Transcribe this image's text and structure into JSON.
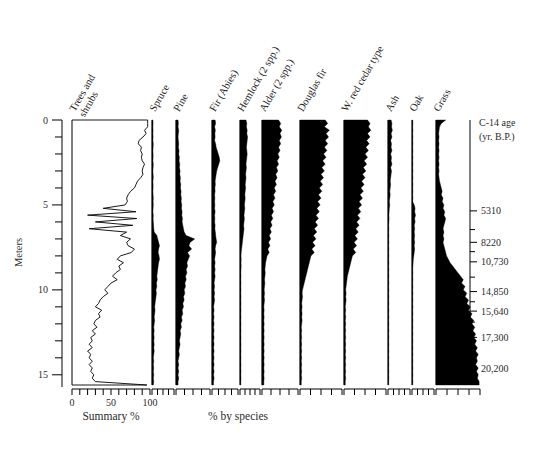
{
  "figure": {
    "type": "pollen-diagram",
    "background_color": "#ffffff",
    "ink_color": "#000000"
  },
  "axes": {
    "depth_axis": {
      "label": "Meters",
      "tick_labels": [
        "0",
        "5",
        "10",
        "15"
      ],
      "tick_values": [
        0,
        5,
        10,
        15
      ],
      "minor_interval": 1,
      "range": [
        0,
        15.6
      ]
    },
    "age_axis": {
      "title_line1": "C-14 age",
      "title_line2": "(yr. B.P.)",
      "tick_labels": [
        "5310",
        "8220",
        "10,730",
        "14,850",
        "15,640",
        "17,300",
        "20,200"
      ],
      "tick_depths_m": [
        5.35,
        7.2,
        8.35,
        10.1,
        11.25,
        12.8,
        14.65
      ],
      "minor_tick_depths_m": [
        6.45,
        7.75,
        9.25,
        10.7,
        11.9,
        13.8
      ]
    },
    "summary_axis": {
      "tick_labels": [
        "0",
        "50",
        "100"
      ],
      "tick_values": [
        0,
        50,
        100
      ],
      "minor_interval": 10,
      "caption": "Summary %"
    },
    "species_axis": {
      "caption": "% by species",
      "minor_ticks_per_column": 4
    }
  },
  "columns": [
    {
      "name": "trees-and-shrubs",
      "label": "Trees and\nshrubs",
      "label_lines": [
        "Trees and",
        "shrubs"
      ],
      "style": "line",
      "width_px": 78,
      "max_percent": 100,
      "axis": "summary"
    },
    {
      "name": "spruce",
      "label": "Spruce",
      "style": "silhouette",
      "width_px": 22,
      "axis": "species"
    },
    {
      "name": "pine",
      "label": "Pine",
      "style": "silhouette",
      "width_px": 34,
      "axis": "species"
    },
    {
      "name": "fir-abies",
      "label": "Fir (Abies)",
      "style": "silhouette",
      "width_px": 26,
      "axis": "species"
    },
    {
      "name": "hemlock",
      "label": "Hemlock (2 spp.)",
      "style": "silhouette",
      "width_px": 20,
      "axis": "species"
    },
    {
      "name": "alder",
      "label": "Alder (2 spp.)",
      "style": "silhouette",
      "width_px": 36,
      "axis": "species"
    },
    {
      "name": "douglas-fir",
      "label": "Douglas fir",
      "style": "silhouette",
      "width_px": 42,
      "axis": "species"
    },
    {
      "name": "w-red-cedar-type",
      "label": "W. red cedar type",
      "style": "silhouette",
      "width_px": 42,
      "axis": "species"
    },
    {
      "name": "ash",
      "label": "Ash",
      "style": "silhouette",
      "width_px": 22,
      "axis": "species"
    },
    {
      "name": "oak",
      "label": "Oak",
      "style": "silhouette",
      "width_px": 22,
      "axis": "species"
    },
    {
      "name": "grass",
      "label": "Grass",
      "style": "silhouette",
      "width_px": 44,
      "axis": "species"
    }
  ],
  "chart_data": {
    "type": "area",
    "title": "",
    "subtitle": "",
    "xlabel": "Summary % / % by species",
    "ylabel": "Meters",
    "ylim": [
      0,
      15.6
    ],
    "y_inverted": true,
    "grid": false,
    "legend": "none",
    "secondary_axis": {
      "label": "C-14 age (yr. B.P.)",
      "ticks": [
        {
          "depth_m": 5.35,
          "age": "5310"
        },
        {
          "depth_m": 7.2,
          "age": "8220"
        },
        {
          "depth_m": 8.35,
          "age": "10,730"
        },
        {
          "depth_m": 10.1,
          "age": "14,850"
        },
        {
          "depth_m": 11.25,
          "age": "15,640"
        },
        {
          "depth_m": 12.8,
          "age": "17,300"
        },
        {
          "depth_m": 14.65,
          "age": "20,200"
        }
      ]
    },
    "depths_m": [
      0.0,
      0.2,
      0.4,
      0.6,
      0.8,
      1.0,
      1.2,
      1.4,
      1.6,
      1.8,
      2.0,
      2.2,
      2.4,
      2.6,
      2.8,
      3.0,
      3.2,
      3.4,
      3.6,
      3.8,
      4.0,
      4.2,
      4.4,
      4.6,
      4.8,
      5.0,
      5.2,
      5.4,
      5.6,
      5.8,
      6.0,
      6.2,
      6.4,
      6.6,
      6.8,
      7.0,
      7.2,
      7.4,
      7.6,
      7.8,
      8.0,
      8.2,
      8.4,
      8.6,
      8.8,
      9.0,
      9.2,
      9.4,
      9.6,
      9.8,
      10.0,
      10.2,
      10.4,
      10.6,
      10.8,
      11.0,
      11.2,
      11.4,
      11.6,
      11.8,
      12.0,
      12.2,
      12.4,
      12.6,
      12.8,
      13.0,
      13.2,
      13.4,
      13.6,
      13.8,
      14.0,
      14.2,
      14.4,
      14.6,
      14.8,
      15.0,
      15.2,
      15.4,
      15.6
    ],
    "series": [
      {
        "name": "Trees and shrubs",
        "unit": "Summary %",
        "values": [
          97,
          97,
          97,
          93,
          95,
          91,
          86,
          85,
          89,
          88,
          90,
          89,
          90,
          93,
          91,
          90,
          91,
          88,
          84,
          82,
          80,
          75,
          72,
          70,
          71,
          68,
          40,
          82,
          20,
          83,
          30,
          78,
          22,
          70,
          62,
          75,
          70,
          72,
          80,
          76,
          62,
          58,
          66,
          60,
          62,
          56,
          52,
          58,
          50,
          46,
          42,
          46,
          40,
          36,
          34,
          30,
          38,
          34,
          36,
          30,
          28,
          32,
          26,
          30,
          24,
          26,
          22,
          26,
          20,
          24,
          22,
          26,
          22,
          26,
          24,
          28,
          26,
          30,
          96
        ]
      },
      {
        "name": "Spruce",
        "unit": "% by species",
        "values": [
          4,
          5,
          4,
          5,
          4,
          5,
          4,
          6,
          5,
          4,
          5,
          5,
          4,
          6,
          5,
          4,
          5,
          6,
          4,
          5,
          5,
          4,
          5,
          6,
          5,
          6,
          5,
          4,
          6,
          5,
          6,
          7,
          8,
          10,
          22,
          26,
          30,
          34,
          30,
          28,
          32,
          34,
          30,
          28,
          26,
          24,
          22,
          24,
          20,
          22,
          18,
          20,
          18,
          16,
          14,
          12,
          14,
          12,
          10,
          12,
          10,
          8,
          10,
          8,
          10,
          8,
          10,
          8,
          10,
          8,
          6,
          8,
          6,
          8,
          6,
          8,
          6,
          8,
          6
        ]
      },
      {
        "name": "Pine",
        "unit": "% by species",
        "values": [
          6,
          7,
          6,
          8,
          7,
          6,
          7,
          8,
          7,
          9,
          8,
          10,
          9,
          11,
          10,
          12,
          11,
          13,
          12,
          14,
          13,
          15,
          14,
          16,
          15,
          17,
          16,
          18,
          17,
          19,
          18,
          20,
          22,
          24,
          30,
          55,
          42,
          38,
          46,
          34,
          40,
          36,
          32,
          34,
          30,
          32,
          28,
          30,
          26,
          28,
          24,
          26,
          22,
          24,
          20,
          22,
          18,
          20,
          16,
          18,
          14,
          16,
          12,
          14,
          12,
          10,
          12,
          10,
          8,
          10,
          8,
          6,
          8,
          6,
          8,
          6,
          8,
          6,
          6
        ]
      },
      {
        "name": "Fir (Abies)",
        "unit": "% by species",
        "values": [
          12,
          14,
          10,
          13,
          11,
          12,
          10,
          14,
          16,
          20,
          24,
          28,
          30,
          26,
          22,
          18,
          16,
          14,
          12,
          13,
          11,
          12,
          10,
          11,
          10,
          11,
          10,
          12,
          10,
          11,
          10,
          12,
          11,
          13,
          14,
          16,
          18,
          14,
          12,
          14,
          12,
          10,
          12,
          10,
          12,
          10,
          12,
          10,
          8,
          10,
          8,
          10,
          8,
          10,
          8,
          6,
          8,
          6,
          8,
          6,
          8,
          6,
          8,
          6,
          8,
          6,
          8,
          6,
          8,
          6,
          8,
          6,
          8,
          6,
          8,
          6,
          8,
          6,
          6
        ]
      },
      {
        "name": "Hemlock (2 spp.)",
        "unit": "% by species",
        "values": [
          30,
          34,
          32,
          36,
          34,
          38,
          36,
          34,
          32,
          34,
          36,
          34,
          32,
          30,
          32,
          30,
          28,
          30,
          28,
          26,
          28,
          26,
          24,
          26,
          24,
          22,
          24,
          22,
          20,
          22,
          20,
          18,
          20,
          18,
          16,
          14,
          12,
          10,
          8,
          6,
          5,
          6,
          5,
          6,
          5,
          4,
          5,
          4,
          5,
          4,
          5,
          4,
          5,
          4,
          5,
          4,
          5,
          4,
          5,
          4,
          5,
          4,
          5,
          4,
          5,
          4,
          5,
          4,
          5,
          4,
          5,
          4,
          5,
          4,
          5,
          4,
          5,
          4,
          4
        ]
      },
      {
        "name": "Alder (2 spp.)",
        "unit": "% by species",
        "values": [
          46,
          52,
          48,
          55,
          50,
          54,
          48,
          52,
          46,
          50,
          44,
          48,
          42,
          46,
          40,
          44,
          38,
          42,
          36,
          40,
          34,
          38,
          32,
          36,
          30,
          34,
          28,
          32,
          26,
          30,
          24,
          28,
          22,
          26,
          20,
          24,
          18,
          22,
          16,
          20,
          14,
          12,
          10,
          9,
          8,
          9,
          8,
          7,
          8,
          7,
          6,
          7,
          6,
          7,
          6,
          5,
          6,
          5,
          6,
          5,
          6,
          5,
          6,
          5,
          6,
          5,
          6,
          5,
          6,
          5,
          6,
          5,
          6,
          5,
          6,
          5,
          6,
          5,
          5
        ]
      },
      {
        "name": "Douglas fir",
        "unit": "% by species",
        "values": [
          60,
          66,
          58,
          70,
          62,
          68,
          60,
          66,
          58,
          64,
          56,
          62,
          54,
          60,
          52,
          58,
          50,
          56,
          48,
          54,
          46,
          52,
          44,
          50,
          42,
          48,
          40,
          46,
          38,
          44,
          36,
          42,
          34,
          40,
          32,
          38,
          30,
          36,
          28,
          34,
          26,
          24,
          22,
          20,
          18,
          16,
          14,
          12,
          10,
          8,
          6,
          5,
          6,
          5,
          4,
          5,
          4,
          5,
          4,
          5,
          4,
          3,
          4,
          3,
          4,
          3,
          4,
          3,
          4,
          3,
          4,
          3,
          4,
          3,
          4,
          3,
          4,
          3,
          3
        ]
      },
      {
        "name": "W. red cedar type",
        "unit": "% by species",
        "values": [
          56,
          62,
          58,
          64,
          56,
          62,
          54,
          60,
          52,
          58,
          50,
          56,
          48,
          54,
          46,
          52,
          44,
          50,
          42,
          48,
          40,
          46,
          38,
          44,
          36,
          42,
          34,
          40,
          32,
          38,
          30,
          36,
          28,
          34,
          26,
          32,
          24,
          30,
          22,
          28,
          20,
          18,
          16,
          14,
          12,
          10,
          8,
          7,
          6,
          5,
          4,
          5,
          4,
          5,
          4,
          3,
          4,
          3,
          4,
          3,
          4,
          3,
          4,
          3,
          4,
          3,
          4,
          3,
          4,
          3,
          4,
          3,
          4,
          3,
          4,
          3,
          4,
          3,
          3
        ]
      },
      {
        "name": "Ash",
        "unit": "% by species",
        "values": [
          14,
          18,
          16,
          20,
          14,
          18,
          12,
          16,
          14,
          18,
          12,
          16,
          14,
          18,
          12,
          16,
          14,
          12,
          10,
          12,
          10,
          8,
          10,
          8,
          6,
          8,
          6,
          5,
          4,
          5,
          4,
          3,
          4,
          3,
          4,
          3,
          4,
          3,
          4,
          3,
          4,
          3,
          4,
          3,
          4,
          3,
          4,
          3,
          4,
          3,
          4,
          3,
          4,
          3,
          4,
          3,
          4,
          3,
          4,
          3,
          4,
          3,
          4,
          3,
          4,
          3,
          4,
          3,
          4,
          3,
          4,
          3,
          4,
          3,
          4,
          3,
          4,
          3,
          3
        ]
      },
      {
        "name": "Oak",
        "unit": "% by species",
        "values": [
          3,
          4,
          3,
          4,
          3,
          4,
          3,
          4,
          3,
          4,
          3,
          4,
          3,
          4,
          3,
          4,
          3,
          4,
          3,
          4,
          3,
          4,
          3,
          4,
          3,
          10,
          14,
          12,
          16,
          12,
          14,
          10,
          12,
          10,
          12,
          10,
          12,
          10,
          12,
          10,
          8,
          6,
          5,
          4,
          3,
          4,
          3,
          4,
          3,
          4,
          3,
          4,
          3,
          4,
          3,
          4,
          3,
          4,
          3,
          4,
          3,
          4,
          3,
          4,
          3,
          4,
          3,
          4,
          3,
          4,
          3,
          4,
          3,
          4,
          3,
          4,
          3,
          4,
          3
        ]
      },
      {
        "name": "Grass",
        "unit": "% by species",
        "values": [
          22,
          12,
          8,
          7,
          6,
          7,
          6,
          7,
          6,
          7,
          6,
          7,
          6,
          7,
          6,
          7,
          6,
          7,
          8,
          10,
          12,
          14,
          12,
          16,
          14,
          18,
          16,
          20,
          18,
          22,
          20,
          18,
          16,
          18,
          16,
          18,
          16,
          18,
          20,
          22,
          24,
          28,
          32,
          38,
          44,
          50,
          56,
          62,
          58,
          66,
          62,
          70,
          66,
          74,
          70,
          78,
          74,
          82,
          78,
          86,
          82,
          88,
          84,
          90,
          86,
          92,
          88,
          94,
          90,
          96,
          92,
          94,
          90,
          96,
          92,
          96,
          94,
          98,
          98
        ]
      }
    ]
  },
  "faint_top_text": ""
}
